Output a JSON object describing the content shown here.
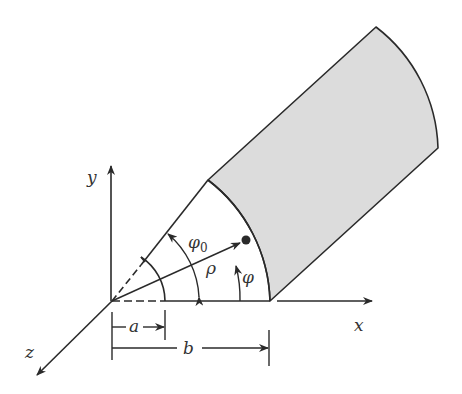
{
  "figure": {
    "colors": {
      "stroke": "#2a2a2a",
      "fill": "#dcdcdc",
      "background": "#ffffff"
    },
    "axes": {
      "x": "x",
      "y": "y",
      "z": "z"
    },
    "labels": {
      "phi0_main": "φ",
      "phi0_sub": "0",
      "rho": "ρ",
      "phi": "φ",
      "a": "a",
      "b": "b"
    }
  }
}
